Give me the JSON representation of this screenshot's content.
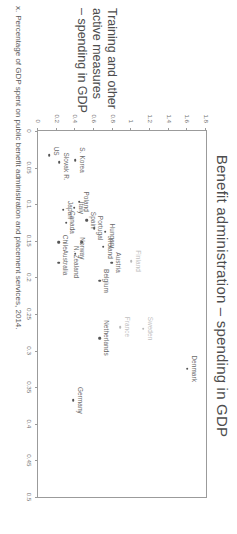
{
  "chart_data": {
    "type": "scatter",
    "title": "Benefit administration – spending in GDP",
    "xlabel": "Benefit administration – spending in GDP",
    "ylabel_lines": [
      "Training and other",
      "active measures",
      "– spending in GDP"
    ],
    "xlim": [
      0,
      0.5
    ],
    "ylim": [
      0,
      1.8
    ],
    "xticks": [
      "0",
      "0.05",
      "0.1",
      "0.15",
      "0.2",
      "0.25",
      "0.3",
      "0.35",
      "0.4",
      "0.45",
      "0.5"
    ],
    "xtick_values": [
      0,
      0.05,
      0.1,
      0.15,
      0.2,
      0.25,
      0.3,
      0.35,
      0.4,
      0.45,
      0.5
    ],
    "yticks": [
      "0",
      "0.2",
      "0.4",
      "0.6",
      "0.8",
      "1",
      "1.2",
      "1.4",
      "1.6",
      "1.8"
    ],
    "ytick_values": [
      0,
      0.2,
      0.4,
      0.6,
      0.8,
      1.0,
      1.2,
      1.4,
      1.6,
      1.8
    ],
    "grid": false,
    "legend": null,
    "points": [
      {
        "label": "Denmark",
        "x": 0.325,
        "y": 1.6,
        "label_dx": 0,
        "label_dy": -7,
        "faint": false
      },
      {
        "label": "Sweden",
        "x": 0.27,
        "y": 1.13,
        "label_dx": 0,
        "label_dy": -7,
        "faint": true
      },
      {
        "label": "Finland",
        "x": 0.178,
        "y": 1.0,
        "label_dx": 0,
        "label_dy": -7,
        "faint": true
      },
      {
        "label": "France",
        "x": 0.268,
        "y": 0.88,
        "label_dx": 0,
        "label_dy": -7,
        "faint": true
      },
      {
        "label": "Austria",
        "x": 0.18,
        "y": 0.79,
        "label_dx": 0,
        "label_dy": -7,
        "faint": false
      },
      {
        "label": "Hungary",
        "x": 0.138,
        "y": 0.72,
        "label_dx": 4,
        "label_dy": -7,
        "faint": false
      },
      {
        "label": "Ireland",
        "x": 0.158,
        "y": 0.7,
        "label_dx": 2,
        "label_dy": -7,
        "faint": false
      },
      {
        "label": "Netherlands",
        "x": 0.283,
        "y": 0.66,
        "label_dx": 0,
        "label_dy": -7,
        "faint": false
      },
      {
        "label": "Belgium",
        "x": 0.205,
        "y": 0.66,
        "label_dx": 0,
        "label_dy": -7,
        "faint": false
      },
      {
        "label": "Portugal",
        "x": 0.133,
        "y": 0.6,
        "label_dx": 0,
        "label_dy": -7,
        "faint": false
      },
      {
        "label": "Spain",
        "x": 0.122,
        "y": 0.52,
        "label_dx": 0,
        "label_dy": -7,
        "faint": false
      },
      {
        "label": "Norway",
        "x": 0.152,
        "y": 0.47,
        "label_dx": 6,
        "label_dy": -1,
        "faint": false
      },
      {
        "label": "N. Zealand",
        "x": 0.168,
        "y": 0.4,
        "label_dx": 8,
        "label_dy": -1,
        "faint": false
      },
      {
        "label": "Germany",
        "x": 0.368,
        "y": 0.38,
        "label_dx": 0,
        "label_dy": -7,
        "faint": false
      },
      {
        "label": "Poland",
        "x": 0.097,
        "y": 0.44,
        "label_dx": 0,
        "label_dy": -7,
        "faint": false
      },
      {
        "label": "Italy",
        "x": 0.105,
        "y": 0.39,
        "label_dx": 0,
        "label_dy": -7,
        "faint": false
      },
      {
        "label": "S. Korea",
        "x": 0.04,
        "y": 0.4,
        "label_dx": 0,
        "label_dy": -7,
        "faint": false
      },
      {
        "label": "Canada",
        "x": 0.125,
        "y": 0.3,
        "label_dx": 0,
        "label_dy": -7,
        "faint": false
      },
      {
        "label": "Japan",
        "x": 0.108,
        "y": 0.27,
        "label_dx": 0,
        "label_dy": -7,
        "faint": false
      },
      {
        "label": "Chile",
        "x": 0.152,
        "y": 0.22,
        "label_dx": 0,
        "label_dy": -7,
        "faint": false
      },
      {
        "label": "Australia",
        "x": 0.18,
        "y": 0.22,
        "label_dx": 0,
        "label_dy": -7,
        "faint": false
      },
      {
        "label": "Slovak R.",
        "x": 0.043,
        "y": 0.23,
        "label_dx": 4,
        "label_dy": -7,
        "faint": false
      },
      {
        "label": "US",
        "x": 0.033,
        "y": 0.12,
        "label_dx": -4,
        "label_dy": -7,
        "faint": false
      }
    ]
  },
  "footnote": {
    "marker": "x.",
    "text": "Percentage of GDP spent on public benefit administration and placement services, 2014."
  }
}
